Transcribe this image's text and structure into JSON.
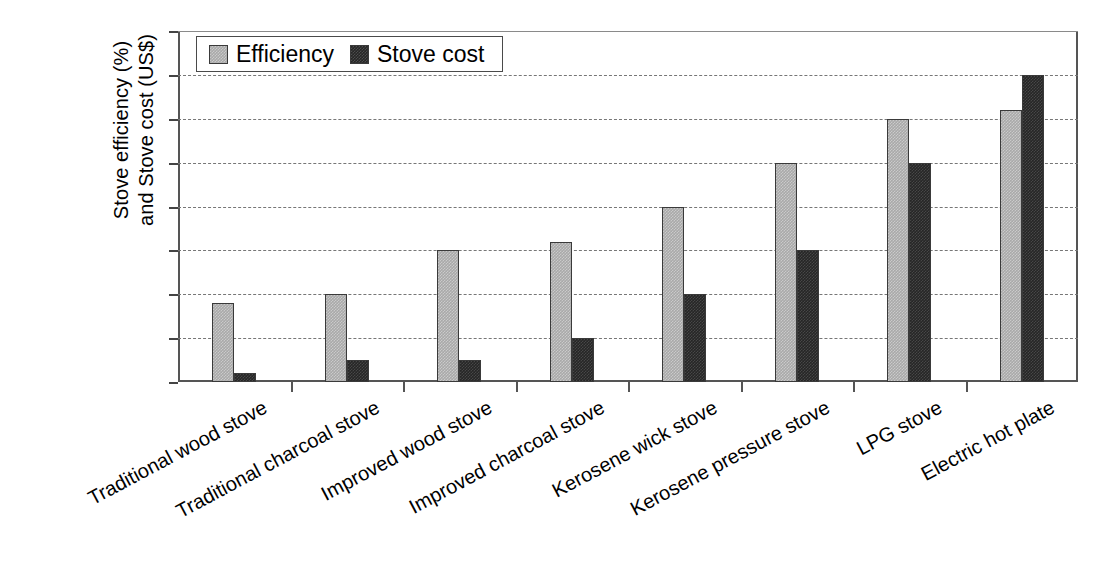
{
  "chart_data": {
    "type": "bar",
    "title": "",
    "xlabel": "",
    "ylabel": "Stove efficiency (%) and Stove cost (US$)",
    "ylabel_line1": "Stove efficiency (%)",
    "ylabel_line2": "and Stove cost (US$)",
    "ylim": [
      0,
      80
    ],
    "ytick_step": 10,
    "yticks": [
      0,
      10,
      20,
      30,
      40,
      50,
      60,
      70,
      80
    ],
    "grid": "horizontal-dashed",
    "legend_position": "top-left-inside",
    "categories": [
      "Traditional wood stove",
      "Traditional charcoal stove",
      "Improved wood stove",
      "Improved charcoal stove",
      "Kerosene wick stove",
      "Kerosene pressure stove",
      "LPG stove",
      "Electric hot plate"
    ],
    "series": [
      {
        "name": "Efficiency",
        "unit": "%",
        "color": "#a9a9a9",
        "values": [
          18,
          20,
          30,
          32,
          40,
          50,
          60,
          62
        ]
      },
      {
        "name": "Stove cost",
        "unit": "US$",
        "color": "#262626",
        "values": [
          2,
          5,
          5,
          10,
          20,
          30,
          50,
          70
        ]
      }
    ]
  },
  "legend": {
    "items": [
      {
        "label": "Efficiency",
        "swatch": "efficiency"
      },
      {
        "label": "Stove cost",
        "swatch": "cost"
      }
    ]
  }
}
